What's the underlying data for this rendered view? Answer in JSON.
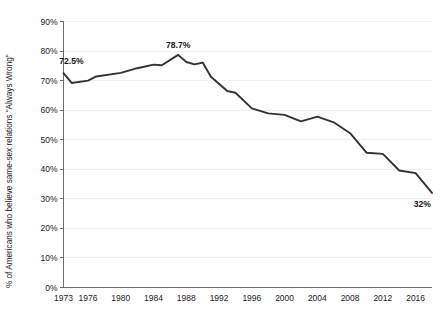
{
  "chart_data": {
    "type": "line",
    "title": "",
    "subtitle": "",
    "xlabel": "",
    "ylabel": "% of Americans who believe same-sex relations \"Always Wrong\"",
    "xlim": [
      1973,
      2018
    ],
    "ylim": [
      0,
      90
    ],
    "grid": true,
    "legend": "none",
    "y_ticks": [
      "0%",
      "10%",
      "20%",
      "30%",
      "40%",
      "50%",
      "60%",
      "70%",
      "80%",
      "90%"
    ],
    "y_tick_values": [
      0,
      10,
      20,
      30,
      40,
      50,
      60,
      70,
      80,
      90
    ],
    "x_ticks": [
      "1973",
      "1976",
      "1980",
      "1984",
      "1988",
      "1992",
      "1996",
      "2000",
      "2004",
      "2008",
      "2012",
      "2016"
    ],
    "x_tick_values": [
      1973,
      1976,
      1980,
      1984,
      1988,
      1992,
      1996,
      2000,
      2004,
      2008,
      2012,
      2016
    ],
    "series": [
      {
        "name": "Always Wrong",
        "x": [
          1973,
          1974,
          1976,
          1977,
          1980,
          1982,
          1984,
          1985,
          1987,
          1988,
          1989,
          1990,
          1991,
          1993,
          1994,
          1996,
          1998,
          2000,
          2002,
          2004,
          2006,
          2008,
          2010,
          2012,
          2014,
          2016,
          2018
        ],
        "values": [
          72.5,
          69.2,
          70.0,
          71.4,
          72.6,
          74.2,
          75.4,
          75.2,
          78.7,
          76.3,
          75.5,
          76.1,
          71.3,
          66.5,
          65.9,
          60.6,
          58.9,
          58.4,
          56.2,
          57.8,
          55.9,
          52.2,
          45.6,
          45.2,
          39.6,
          38.7,
          32.0
        ]
      }
    ],
    "annotations": [
      {
        "label": "72.5%",
        "x": 1973,
        "y": 72.5,
        "position": "above-left"
      },
      {
        "label": "78.7%",
        "x": 1987,
        "y": 78.7,
        "position": "above"
      },
      {
        "label": "32%",
        "x": 2018,
        "y": 32.0,
        "position": "below-left"
      }
    ]
  },
  "colors": {
    "line": "#333333",
    "grid": "#f1f1f1",
    "axis": "#6e6e6e",
    "text": "#1a1a1a",
    "background": "#ffffff"
  }
}
